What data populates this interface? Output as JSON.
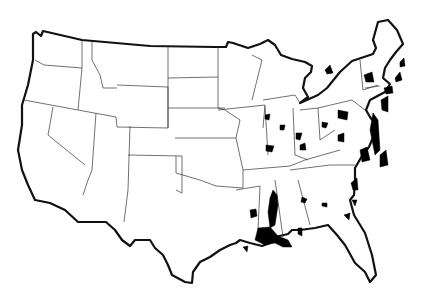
{
  "map": {
    "subject": "Contiguous United States with state boundaries",
    "style": "black-and-white outline map",
    "colors": {
      "outline": "#111111",
      "state_border": "#333333",
      "highlight": "#000000",
      "background": "#ffffff"
    },
    "highlighted_regions_count": 40,
    "highlighted_areas_description": [
      "Lower Mississippi River (Mississippi/Louisiana/Arkansas)",
      "Louisiana Gulf Coast",
      "Mobile Bay, Alabama",
      "Central Alabama",
      "Western Georgia",
      "Georgia/South Carolina coast",
      "Chesapeake Bay region",
      "Delaware/New Jersey coast",
      "New York City area",
      "Boston/Massachusetts coast",
      "Maine coast",
      "Upstate New York",
      "Eastern Iowa/Illinois",
      "Western Missouri",
      "Southern Indiana",
      "Ohio",
      "West Virginia",
      "Western Pennsylvania",
      "Southeast Michigan",
      "Eastern Texas"
    ]
  }
}
